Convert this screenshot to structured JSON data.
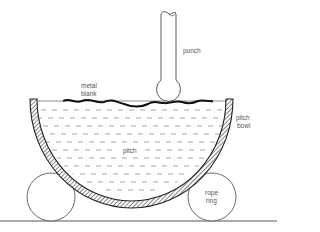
{
  "diagram": {
    "type": "repoussé / chasing setup cross-section",
    "labels": {
      "punch": "punch",
      "metal_blank_line1": "metal",
      "metal_blank_line2": "blank",
      "pitch": "pitch",
      "pitch_bowl_line1": "pitch",
      "pitch_bowl_line2": "bowl",
      "rope_ring_line1": "rope",
      "rope_ring_line2": "ring"
    },
    "components": [
      "punch",
      "metal blank",
      "pitch",
      "pitch bowl",
      "rope ring",
      "rope ring",
      "ground line"
    ],
    "colors": {
      "line": "#222222",
      "label": "#555555",
      "background": "#ffffff"
    }
  }
}
